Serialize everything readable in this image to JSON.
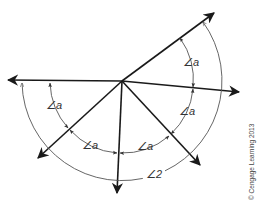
{
  "diagram": {
    "center": [
      122,
      81
    ],
    "rays": [
      {
        "name": "ray-upper-right",
        "end": [
          214,
          13
        ]
      },
      {
        "name": "ray-right",
        "end": [
          239,
          92
        ]
      },
      {
        "name": "ray-lower-right",
        "end": [
          200,
          165
        ]
      },
      {
        "name": "ray-down",
        "end": [
          117,
          193
        ]
      },
      {
        "name": "ray-lower-left",
        "end": [
          38,
          158
        ]
      },
      {
        "name": "ray-left",
        "end": [
          8,
          80
        ]
      }
    ],
    "inner_angle_labels": [
      {
        "text": "∠a",
        "x": 183,
        "y": 66
      },
      {
        "text": "∠a",
        "x": 179,
        "y": 115
      },
      {
        "text": "∠a",
        "x": 137,
        "y": 150
      },
      {
        "text": "∠a",
        "x": 82,
        "y": 149
      },
      {
        "text": "∠a",
        "x": 46,
        "y": 109
      }
    ],
    "outer_angle_label": {
      "text": "∠2",
      "x": 146,
      "y": 178
    },
    "copyright": "© Cengage Learning 2013",
    "colors": {
      "lines": "#1a1a1a",
      "arcs": "#555555",
      "background": "#ffffff"
    }
  }
}
